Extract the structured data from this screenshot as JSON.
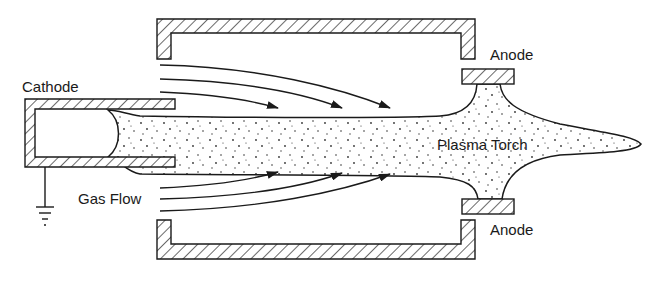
{
  "diagram": {
    "labels": {
      "cathode": "Cathode",
      "gas_flow": "Gas Flow",
      "plasma_torch": "Plasma Torch",
      "anode_top": "Anode",
      "anode_bottom": "Anode"
    },
    "components": [
      "cathode",
      "chamber-top-wall",
      "chamber-bottom-wall",
      "anode-top",
      "anode-bottom",
      "plasma-torch",
      "gas-flow-arrows",
      "ground-symbol"
    ],
    "colors": {
      "stroke": "#1a1a1a",
      "background": "#ffffff"
    }
  }
}
